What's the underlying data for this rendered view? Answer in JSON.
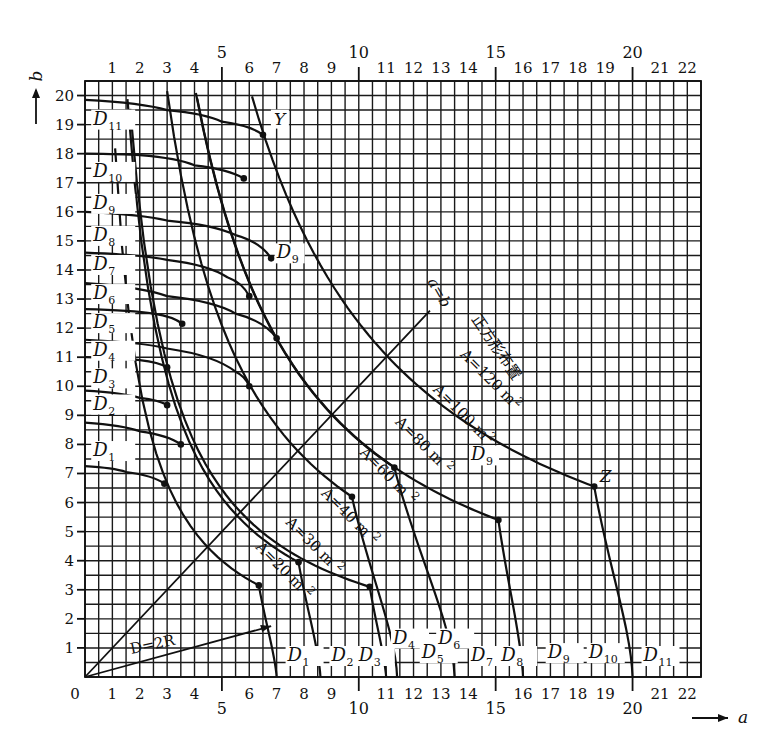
{
  "chart_data": {
    "type": "line",
    "title": "",
    "xlabel": "a",
    "ylabel": "b",
    "xlim": [
      0,
      22.5
    ],
    "ylim": [
      0,
      20.5
    ],
    "grid": true,
    "grid_step": 0.5,
    "x_ticks": {
      "minor_labels": [
        "1",
        "2",
        "3",
        "4",
        "6",
        "7",
        "8",
        "9",
        "11",
        "12",
        "13",
        "14",
        "16",
        "17",
        "18",
        "19",
        "21",
        "22"
      ],
      "major_labels": [
        "5",
        "10",
        "15",
        "20"
      ],
      "origin_label": "0"
    },
    "y_ticks": [
      "1",
      "2",
      "3",
      "4",
      "5",
      "6",
      "7",
      "8",
      "9",
      "10",
      "11",
      "12",
      "13",
      "14",
      "15",
      "16",
      "17",
      "18",
      "19",
      "20"
    ],
    "axis_arrows": {
      "x": "a",
      "y": "b"
    },
    "d_curves": [
      {
        "name": "D",
        "sub": "1",
        "points": [
          [
            0,
            7.25
          ],
          [
            1.5,
            7.05
          ],
          [
            2.9,
            6.65
          ]
        ],
        "end_a": 7.0,
        "knee": [
          2.9,
          6.65
        ]
      },
      {
        "name": "D",
        "sub": "2",
        "points": [
          [
            0,
            8.75
          ],
          [
            2,
            8.45
          ],
          [
            3.5,
            8.0
          ]
        ],
        "end_a": 8.6,
        "knee": [
          3.5,
          8.0
        ]
      },
      {
        "name": "D",
        "sub": "3",
        "points": [
          [
            0,
            9.85
          ],
          [
            2,
            9.6
          ],
          [
            3.0,
            9.35
          ]
        ],
        "end_a": 9.8,
        "knee": [
          3.0,
          9.35
        ]
      },
      {
        "name": "D",
        "sub": "4",
        "points": [
          [
            0,
            11.0
          ],
          [
            2,
            10.9
          ],
          [
            3.0,
            10.65
          ]
        ],
        "end_a": 11.0,
        "knee": [
          3.0,
          10.65
        ]
      },
      {
        "name": "D",
        "sub": "5",
        "points": [
          [
            0,
            11.6
          ],
          [
            3,
            11.3
          ],
          [
            5.5,
            10.5
          ],
          [
            6.0,
            10.0
          ]
        ],
        "end_a": 12.0,
        "knee": [
          6.0,
          10.0
        ]
      },
      {
        "name": "D",
        "sub": "6",
        "points": [
          [
            0,
            12.65
          ],
          [
            2.5,
            12.5
          ],
          [
            3.55,
            12.15
          ]
        ],
        "end_a": 12.9,
        "knee": [
          3.55,
          12.15
        ]
      },
      {
        "name": "D",
        "sub": "7",
        "points": [
          [
            0,
            13.55
          ],
          [
            3,
            13.1
          ],
          [
            5.5,
            12.5
          ],
          [
            7.0,
            11.65
          ]
        ],
        "end_a": 14.0,
        "knee": [
          7.0,
          11.65
        ]
      },
      {
        "name": "D",
        "sub": "8",
        "points": [
          [
            0,
            14.6
          ],
          [
            3,
            14.35
          ],
          [
            5.2,
            13.75
          ],
          [
            6.0,
            13.1
          ]
        ],
        "end_a": 15.0,
        "knee": [
          6.0,
          13.1
        ]
      },
      {
        "name": "D",
        "sub": "9",
        "points": [
          [
            0,
            16.0
          ],
          [
            3,
            15.7
          ],
          [
            5.5,
            15.2
          ],
          [
            6.8,
            14.4
          ]
        ],
        "end_a": 16.0,
        "knee": [
          6.8,
          14.4
        ]
      },
      {
        "name": "D",
        "sub": "10",
        "points": [
          [
            0,
            18.0
          ],
          [
            2,
            17.95
          ],
          [
            4,
            17.6
          ],
          [
            5.8,
            17.15
          ]
        ],
        "end_a": 17.8,
        "knee": [
          5.8,
          17.15
        ]
      },
      {
        "name": "D",
        "sub": "11",
        "points": [
          [
            0,
            19.85
          ],
          [
            3,
            19.5
          ],
          [
            5,
            19.1
          ],
          [
            6.5,
            18.65
          ]
        ],
        "end_a": 19.9,
        "knee": [
          6.5,
          18.65
        ]
      }
    ],
    "area_curves": [
      {
        "label": "A=20 m",
        "sup": "2",
        "area": 20,
        "knee": [
          6.35,
          3.15
        ],
        "end_a": 7.0
      },
      {
        "label": "A=30 m",
        "sup": "2",
        "area": 30,
        "knee": [
          7.8,
          3.95
        ],
        "end_a": 8.6
      },
      {
        "label": "A=40 m",
        "sup": "2",
        "area": 40,
        "knee": [
          10.4,
          3.1
        ],
        "end_a": 11.0
      },
      {
        "label": "A=60 m",
        "sup": "2",
        "area": 60,
        "knee": [
          9.75,
          6.2
        ],
        "end_a": 11.4
      },
      {
        "label": "A=80 m",
        "sup": "2",
        "area": 80,
        "knee": [
          11.3,
          7.2
        ],
        "end_a": 13.5
      },
      {
        "label": "A=100 m",
        "sup": "2",
        "area": 100,
        "knee": [
          15.1,
          5.4
        ],
        "end_a": 16.0
      },
      {
        "label": "A=120 m",
        "sup": "2",
        "area": 120,
        "knee": [
          18.6,
          6.55
        ],
        "end_a": 20.0
      }
    ],
    "annotations": {
      "diagonal": "a=b",
      "square_layout": "正方形布置",
      "radius_line": "D=2R",
      "point_y": "Y",
      "point_z": "Z",
      "d9_prime": "D",
      "d9_prime_sub": "9",
      "d9_mid": "D",
      "d9_mid_sub": "9"
    }
  }
}
